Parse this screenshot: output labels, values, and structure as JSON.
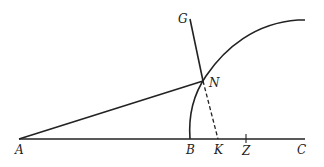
{
  "diagram": {
    "type": "geometric-construction",
    "points": {
      "A": {
        "label": "A",
        "x": 19,
        "y": 139
      },
      "B": {
        "label": "B",
        "x": 190,
        "y": 139
      },
      "K": {
        "label": "K",
        "x": 218,
        "y": 139
      },
      "Z": {
        "label": "Z",
        "x": 246,
        "y": 139
      },
      "C": {
        "label": "C",
        "x": 305,
        "y": 139
      },
      "N": {
        "label": "N",
        "x": 203,
        "y": 81
      },
      "G": {
        "label": "G",
        "x": 190,
        "y": 19
      }
    },
    "labels": {
      "A": "A",
      "B": "B",
      "K": "K",
      "Z": "Z",
      "C": "C",
      "N": "N",
      "G": "G"
    },
    "segments": [
      {
        "from": "A",
        "to": "C",
        "style": "solid",
        "name": "baseline"
      },
      {
        "from": "A",
        "to": "N",
        "style": "solid",
        "name": "line-AN"
      },
      {
        "from": "G",
        "to": "N",
        "style": "solid",
        "name": "line-GN"
      },
      {
        "from": "N",
        "to": "K",
        "style": "dashed",
        "name": "line-NK"
      }
    ],
    "curves": [
      {
        "name": "arc-B-N",
        "from": "B",
        "through": "N",
        "to_end": [
          305,
          20
        ],
        "style": "solid"
      }
    ],
    "ticks": [
      {
        "at": "Z"
      }
    ],
    "colors": {
      "stroke": "#222222",
      "background": "#ffffff"
    }
  }
}
